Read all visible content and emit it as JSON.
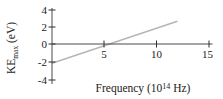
{
  "chart_data": {
    "type": "line",
    "title": "",
    "xlabel": "Frequency (10^14 Hz)",
    "ylabel": "KE_max (eV)",
    "xlim": [
      0,
      15.5
    ],
    "ylim": [
      -4,
      4
    ],
    "x_ticks": [
      5,
      10,
      15
    ],
    "y_ticks": [
      4,
      2,
      0,
      -2,
      -4
    ],
    "grid": false,
    "legend": "none",
    "series": [
      {
        "name": "KE_max vs frequency",
        "x": [
          0,
          12.0
        ],
        "y": [
          -2.2,
          2.6
        ],
        "color": "#b5b5b5"
      }
    ],
    "x_intercept_threshold_frequency": 5.6,
    "slope_eV_per_1e14Hz": 0.4
  },
  "labels": {
    "ylabel_parts": {
      "pre": "KE",
      "sub": "max",
      "post": " (eV)"
    },
    "xlabel_parts": {
      "pre": "Frequency (10",
      "sup": "14",
      "post": " Hz)"
    }
  },
  "colors": {
    "axis": "#4a4a4a",
    "line": "#b5b5b5",
    "text": "#1b1b1b",
    "background": "#ffffff"
  }
}
